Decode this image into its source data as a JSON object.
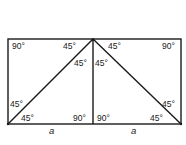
{
  "diagram": {
    "type": "geometry",
    "stroke_color": "#1a1a1a",
    "background": "#ffffff",
    "shapes": {
      "rectangle": {
        "x1": 8,
        "y1": 39,
        "x2": 181,
        "y2": 124
      },
      "vertical_line": {
        "x1": 93,
        "y1": 39,
        "x2": 93,
        "y2": 124
      },
      "diagonal_left": {
        "x1": 8,
        "y1": 124,
        "x2": 93,
        "y2": 39
      },
      "diagonal_right": {
        "x1": 93,
        "y1": 39,
        "x2": 181,
        "y2": 124
      }
    },
    "angle_labels": [
      {
        "id": "top-left-corner",
        "text": "90°",
        "x": 12,
        "y": 49
      },
      {
        "id": "left-apex-outer",
        "text": "45°",
        "x": 63,
        "y": 49
      },
      {
        "id": "left-apex-inner",
        "text": "45°",
        "x": 74,
        "y": 66
      },
      {
        "id": "right-apex-inner",
        "text": "45°",
        "x": 95,
        "y": 66
      },
      {
        "id": "right-apex-outer",
        "text": "45°",
        "x": 108,
        "y": 49
      },
      {
        "id": "top-right-corner",
        "text": "90°",
        "x": 162,
        "y": 49
      },
      {
        "id": "bottom-left-upper",
        "text": "45°",
        "x": 10,
        "y": 107
      },
      {
        "id": "bottom-left-lower",
        "text": "45°",
        "x": 21,
        "y": 121
      },
      {
        "id": "bottom-center-left",
        "text": "90°",
        "x": 73,
        "y": 121
      },
      {
        "id": "bottom-center-right",
        "text": "90°",
        "x": 97,
        "y": 121
      },
      {
        "id": "bottom-right-upper",
        "text": "45°",
        "x": 162,
        "y": 107
      },
      {
        "id": "bottom-right-lower",
        "text": "45°",
        "x": 150,
        "y": 121
      }
    ],
    "side_labels": [
      {
        "id": "left-base",
        "text": "a",
        "x": 49,
        "y": 134
      },
      {
        "id": "right-base",
        "text": "a",
        "x": 131,
        "y": 134
      }
    ]
  }
}
